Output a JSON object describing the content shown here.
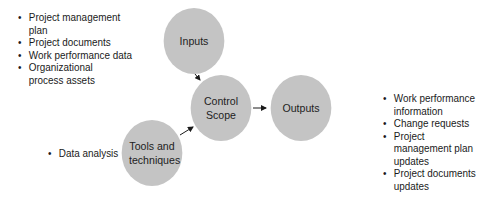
{
  "nodes": {
    "inputs": {
      "label": "Inputs"
    },
    "control": {
      "label": "Control Scope"
    },
    "outputs": {
      "label": "Outputs"
    },
    "tools": {
      "label": "Tools and techniques"
    }
  },
  "inputs_list": [
    "Project management plan",
    "Project documents",
    "Work performance data",
    "Organizational process assets"
  ],
  "tools_list": [
    "Data analysis"
  ],
  "outputs_list": [
    "Work performance information",
    "Change requests",
    "Project management plan updates",
    "Project documents updates"
  ],
  "colors": {
    "circle": "#c4c4c4",
    "text": "#1a1a1a"
  }
}
